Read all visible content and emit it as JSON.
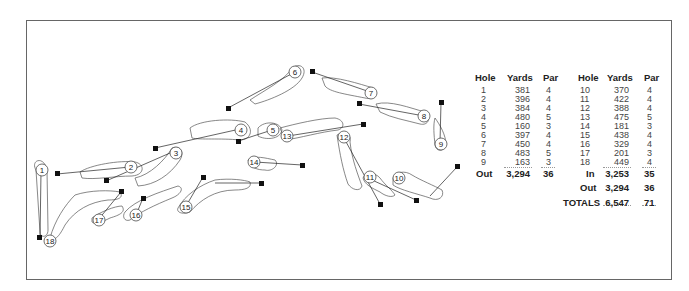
{
  "scorecard": {
    "headers": [
      "Hole",
      "Yards",
      "Par",
      "Hole",
      "Yards",
      "Par"
    ],
    "front_nine": [
      {
        "hole": "1",
        "yards": "381",
        "par": "4"
      },
      {
        "hole": "2",
        "yards": "396",
        "par": "4"
      },
      {
        "hole": "3",
        "yards": "384",
        "par": "4"
      },
      {
        "hole": "4",
        "yards": "480",
        "par": "5"
      },
      {
        "hole": "5",
        "yards": "160",
        "par": "3"
      },
      {
        "hole": "6",
        "yards": "397",
        "par": "4"
      },
      {
        "hole": "7",
        "yards": "450",
        "par": "4"
      },
      {
        "hole": "8",
        "yards": "483",
        "par": "5"
      },
      {
        "hole": "9",
        "yards": "163",
        "par": "3"
      }
    ],
    "back_nine": [
      {
        "hole": "10",
        "yards": "370",
        "par": "4"
      },
      {
        "hole": "11",
        "yards": "422",
        "par": "4"
      },
      {
        "hole": "12",
        "yards": "388",
        "par": "4"
      },
      {
        "hole": "13",
        "yards": "475",
        "par": "5"
      },
      {
        "hole": "14",
        "yards": "181",
        "par": "3"
      },
      {
        "hole": "15",
        "yards": "438",
        "par": "4"
      },
      {
        "hole": "16",
        "yards": "329",
        "par": "4"
      },
      {
        "hole": "17",
        "yards": "201",
        "par": "3"
      },
      {
        "hole": "18",
        "yards": "449",
        "par": "4"
      }
    ],
    "out_row": {
      "label": "Out",
      "yards": "3,294",
      "par": "36"
    },
    "in_row": {
      "label": "In",
      "yards": "3,253",
      "par": "35"
    },
    "out_row_2": {
      "label": "Out",
      "yards": "3,294",
      "par": "36"
    },
    "totals_row": {
      "label": "TOTALS",
      "yards": "6,547",
      "par": "71"
    }
  },
  "map": {
    "holes": [
      {
        "number": "1"
      },
      {
        "number": "2"
      },
      {
        "number": "3"
      },
      {
        "number": "4"
      },
      {
        "number": "5"
      },
      {
        "number": "6"
      },
      {
        "number": "7"
      },
      {
        "number": "8"
      },
      {
        "number": "9"
      },
      {
        "number": "10"
      },
      {
        "number": "11"
      },
      {
        "number": "12"
      },
      {
        "number": "13"
      },
      {
        "number": "14"
      },
      {
        "number": "15"
      },
      {
        "number": "16"
      },
      {
        "number": "17"
      },
      {
        "number": "18"
      }
    ]
  }
}
